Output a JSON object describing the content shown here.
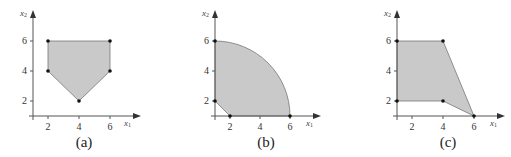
{
  "figure": {
    "panels": [
      {
        "id": "a",
        "caption": "(a)",
        "x_axis_label": "x",
        "x_axis_sub": "1",
        "y_axis_label": "x",
        "y_axis_sub": "2",
        "x_ticks": [
          "2",
          "4",
          "6"
        ],
        "y_ticks": [
          "2",
          "4",
          "6"
        ],
        "region_shape": "polygon",
        "vertices": [
          [
            2,
            6
          ],
          [
            6,
            6
          ],
          [
            6,
            4
          ],
          [
            4,
            2
          ],
          [
            2,
            4
          ]
        ]
      },
      {
        "id": "b",
        "caption": "(b)",
        "x_axis_label": "x",
        "x_axis_sub": "1",
        "y_axis_label": "x",
        "y_axis_sub": "2",
        "x_ticks": [
          "2",
          "4",
          "6"
        ],
        "y_ticks": [
          "2",
          "4",
          "6"
        ],
        "region_shape": "quarter-disk minus corner triangle",
        "vertices": [
          [
            1,
            6
          ],
          [
            1,
            2
          ],
          [
            2,
            1
          ],
          [
            6,
            1
          ]
        ],
        "arc": {
          "center": [
            1,
            1
          ],
          "radius": 5
        }
      },
      {
        "id": "c",
        "caption": "(c)",
        "x_axis_label": "x",
        "x_axis_sub": "1",
        "y_axis_label": "x",
        "y_axis_sub": "2",
        "x_ticks": [
          "2",
          "4",
          "6"
        ],
        "y_ticks": [
          "2",
          "4",
          "6"
        ],
        "region_shape": "polygon",
        "vertices": [
          [
            1,
            6
          ],
          [
            4,
            6
          ],
          [
            6,
            1
          ],
          [
            4,
            2
          ],
          [
            1,
            2
          ]
        ]
      }
    ],
    "colors": {
      "fill": "#c9c9c9",
      "axis": "#555555",
      "vertex": "#111111"
    }
  }
}
